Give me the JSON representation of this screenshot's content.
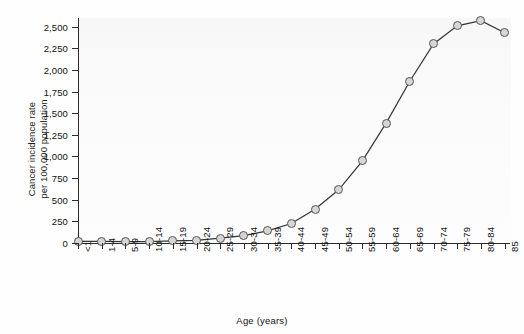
{
  "chart_data": {
    "type": "line",
    "title": "",
    "xlabel": "Age (years)",
    "ylabel_line1": "Cancer incidence rate",
    "ylabel_line2": "per 100,000 population",
    "categories": [
      "<1",
      "1-4",
      "5-9",
      "10-14",
      "15-19",
      "20-24",
      "25-29",
      "30-34",
      "35-39",
      "40-44",
      "45-49",
      "50-54",
      "55-59",
      "60-64",
      "65-69",
      "70-74",
      "75-79",
      "80-84",
      "85"
    ],
    "values": [
      20,
      20,
      15,
      15,
      25,
      30,
      55,
      85,
      140,
      225,
      390,
      615,
      950,
      1385,
      1870,
      2300,
      2510,
      2570,
      2430
    ],
    "ytick_labels": [
      "0",
      "250",
      "500",
      "750",
      "1,000",
      "1,250",
      "1,500",
      "1,750",
      "2,000",
      "2,250",
      "2,500"
    ],
    "ytick_values": [
      0,
      250,
      500,
      750,
      1000,
      1250,
      1500,
      1750,
      2000,
      2250,
      2500
    ],
    "ylim": [
      0,
      2600
    ],
    "grid": false,
    "legend": "none",
    "marker_fill": "#d6d6d6",
    "marker_stroke": "#555555",
    "line_color": "#333333",
    "plot_background": "#f8f8f8"
  }
}
